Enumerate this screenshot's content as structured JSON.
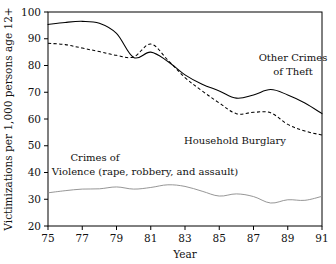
{
  "chart_data": {
    "type": "line",
    "title": "",
    "xlabel": "Year",
    "ylabel": "Victimizations per 1,000 persons age 12+",
    "xlim": [
      75,
      91
    ],
    "ylim": [
      20,
      100
    ],
    "xticks": [
      75,
      77,
      79,
      81,
      83,
      85,
      87,
      89,
      91
    ],
    "xtick_labels": [
      "75",
      "77",
      "79",
      "81",
      "83",
      "85",
      "87",
      "89",
      "91"
    ],
    "yticks": [
      20,
      30,
      40,
      50,
      60,
      70,
      80,
      90,
      100
    ],
    "ytick_labels": [
      "20",
      "30",
      "40",
      "50",
      "60",
      "70",
      "80",
      "90",
      "100"
    ],
    "grid": false,
    "legend_position": "inline-annotations",
    "x": [
      75,
      76,
      77,
      78,
      79,
      80,
      81,
      82,
      83,
      84,
      85,
      86,
      87,
      88,
      89,
      90,
      91
    ],
    "series": [
      {
        "name": "Other Crimes of Theft",
        "style": "solid",
        "color": "#000000",
        "values": [
          95.3,
          96.1,
          96.5,
          95.8,
          92.0,
          83.0,
          85.0,
          81.5,
          76.5,
          73.0,
          70.5,
          67.8,
          69.0,
          71.0,
          69.0,
          66.0,
          62.0
        ]
      },
      {
        "name": "Household Burglary",
        "style": "dashed",
        "color": "#000000",
        "values": [
          88.3,
          87.8,
          86.5,
          85.2,
          83.8,
          83.2,
          88.0,
          82.0,
          75.5,
          70.5,
          66.0,
          62.0,
          62.5,
          62.3,
          58.0,
          55.5,
          54.0
        ]
      },
      {
        "name": "Crimes of Violence (rape, robbery, and assault)",
        "style": "thin",
        "color": "#8a8a8a",
        "values": [
          32.4,
          33.2,
          33.8,
          33.9,
          34.6,
          33.8,
          34.4,
          35.4,
          34.8,
          33.0,
          31.2,
          32.0,
          31.0,
          28.6,
          29.8,
          29.6,
          31.1
        ]
      }
    ],
    "annotations": [
      {
        "name": "other-crimes-of-theft",
        "lines": [
          "Other Crimes",
          "of Theft"
        ]
      },
      {
        "name": "household-burglary",
        "lines": [
          "Household Burglary"
        ]
      },
      {
        "name": "crimes-of-violence",
        "lines": [
          "Crimes of",
          "Violence (rape, robbery, and assault)"
        ]
      }
    ]
  }
}
